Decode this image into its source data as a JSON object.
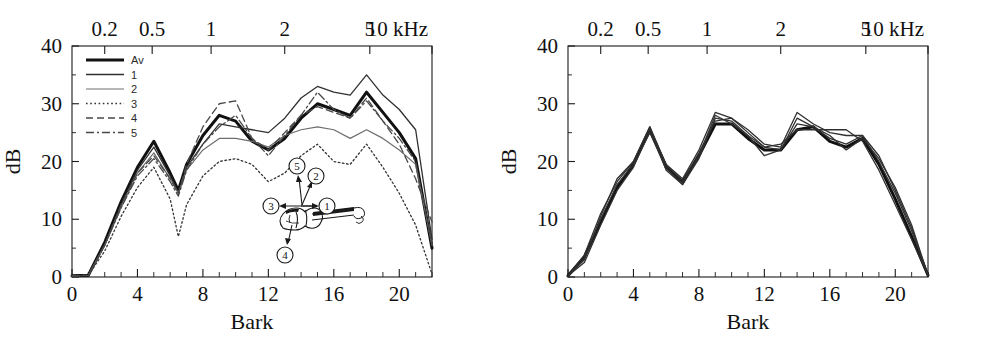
{
  "figure": {
    "background": "#ffffff",
    "ink": "#111111"
  },
  "panels": [
    {
      "id": "left",
      "name": "violin-radiation-spectrum-left",
      "axes": {
        "y": {
          "title": "dB",
          "ticks": [
            0,
            10,
            20,
            30,
            40
          ],
          "labels": [
            "0",
            "10",
            "20",
            "30",
            "40"
          ],
          "min": 0,
          "max": 40
        },
        "x_bottom": {
          "title": "Bark",
          "ticks": [
            0,
            4,
            8,
            12,
            16,
            20
          ],
          "labels": [
            "0",
            "4",
            "8",
            "12",
            "16",
            "20"
          ],
          "minor_step": 2,
          "min": 0,
          "max": 22
        },
        "x_top": {
          "title": "kHz",
          "labels": [
            "0.2",
            "0.5",
            "1",
            "2",
            "5",
            "10 kHz"
          ],
          "bark_positions": [
            2.0,
            4.9,
            8.5,
            13.0,
            18.2,
            22.0
          ]
        }
      },
      "legend": {
        "entries": [
          {
            "label": "Av",
            "style": "thick-solid",
            "color": "#111111",
            "width": 3.2,
            "dash": "none"
          },
          {
            "label": "1",
            "style": "solid",
            "color": "#333333",
            "width": 1.4,
            "dash": "none"
          },
          {
            "label": "2",
            "style": "solid-light",
            "color": "#6e6e6e",
            "width": 1.2,
            "dash": "none"
          },
          {
            "label": "3",
            "style": "dotted",
            "color": "#333333",
            "width": 1.3,
            "dash": "1.5,2.5"
          },
          {
            "label": "4",
            "style": "dashed",
            "color": "#4a4a4a",
            "width": 1.3,
            "dash": "7,4"
          },
          {
            "label": "5",
            "style": "dash-dot",
            "color": "#4a4a4a",
            "width": 1.3,
            "dash": "8,3,2,3"
          }
        ]
      },
      "inset": {
        "name": "violin-microphone-positions",
        "callouts": [
          {
            "id": "1",
            "label": "1"
          },
          {
            "id": "2",
            "label": "2"
          },
          {
            "id": "3",
            "label": "3"
          },
          {
            "id": "4",
            "label": "4"
          },
          {
            "id": "5",
            "label": "5"
          }
        ]
      }
    },
    {
      "id": "right",
      "name": "violin-radiation-spectrum-right",
      "axes": {
        "y": {
          "title": "dB",
          "ticks": [
            0,
            10,
            20,
            30,
            40
          ],
          "labels": [
            "0",
            "10",
            "20",
            "30",
            "40"
          ],
          "min": 0,
          "max": 40
        },
        "x_bottom": {
          "title": "Bark",
          "ticks": [
            0,
            4,
            8,
            12,
            16,
            20
          ],
          "labels": [
            "0",
            "4",
            "8",
            "12",
            "16",
            "20"
          ],
          "minor_step": 2,
          "min": 0,
          "max": 22
        },
        "x_top": {
          "title": "kHz",
          "labels": [
            "0.2",
            "0.5",
            "1",
            "2",
            "5",
            "10 kHz"
          ],
          "bark_positions": [
            2.0,
            4.9,
            8.5,
            13.0,
            18.2,
            22.0
          ]
        }
      }
    }
  ],
  "chart_data": [
    {
      "type": "line",
      "id": "left-panel",
      "title": "",
      "xlabel": "Bark",
      "ylabel": "dB",
      "x_top_label": "kHz",
      "xlim": [
        0,
        22
      ],
      "ylim": [
        0,
        40
      ],
      "grid": false,
      "legend_position": "top-left",
      "x": [
        0,
        1,
        2,
        3,
        4,
        5,
        6,
        6.5,
        7,
        8,
        9,
        10,
        11,
        12,
        13,
        14,
        15,
        16,
        17,
        18,
        19,
        20,
        21,
        22
      ],
      "series": [
        {
          "name": "Av",
          "style": "thick-solid",
          "values": [
            0.2,
            0.3,
            6.0,
            13.0,
            19.0,
            23.5,
            18.0,
            15.0,
            19.5,
            24.5,
            28.0,
            27.0,
            23.5,
            22.0,
            24.0,
            27.5,
            30.0,
            29.0,
            28.0,
            32.0,
            28.5,
            25.0,
            20.5,
            5.0
          ]
        },
        {
          "name": "1",
          "style": "solid",
          "values": [
            0.2,
            0.3,
            5.5,
            12.5,
            18.5,
            22.5,
            17.5,
            14.5,
            19.0,
            23.0,
            26.5,
            26.0,
            25.5,
            25.0,
            27.5,
            31.0,
            33.0,
            32.0,
            31.5,
            35.0,
            31.5,
            29.0,
            25.5,
            6.5
          ]
        },
        {
          "name": "2",
          "style": "solid-light",
          "values": [
            0.2,
            0.3,
            5.5,
            12.0,
            18.0,
            21.5,
            17.0,
            14.5,
            18.5,
            22.0,
            24.0,
            24.0,
            23.5,
            22.5,
            24.5,
            25.5,
            26.0,
            25.5,
            24.0,
            25.5,
            24.0,
            22.0,
            19.5,
            5.5
          ]
        },
        {
          "name": "3",
          "style": "dotted",
          "values": [
            0.2,
            0.3,
            4.5,
            10.5,
            15.5,
            19.0,
            13.5,
            7.0,
            12.5,
            17.5,
            20.0,
            20.5,
            19.5,
            16.5,
            18.0,
            21.0,
            23.0,
            20.0,
            19.5,
            23.0,
            19.0,
            14.5,
            9.0,
            0.5
          ]
        },
        {
          "name": "4",
          "style": "dashed",
          "values": [
            0.2,
            0.3,
            5.5,
            12.5,
            18.0,
            21.0,
            17.0,
            14.5,
            19.5,
            26.0,
            30.0,
            30.5,
            24.0,
            22.0,
            25.0,
            28.0,
            29.5,
            28.5,
            27.5,
            31.0,
            27.0,
            23.0,
            17.0,
            9.5
          ]
        },
        {
          "name": "5",
          "style": "dash-dot",
          "values": [
            0.2,
            0.3,
            5.5,
            12.0,
            17.5,
            20.5,
            16.5,
            14.0,
            18.5,
            23.0,
            26.0,
            28.0,
            24.0,
            21.0,
            24.5,
            28.0,
            32.0,
            29.0,
            27.5,
            30.5,
            27.0,
            24.0,
            20.0,
            5.5
          ]
        }
      ]
    },
    {
      "type": "line",
      "id": "right-panel",
      "title": "",
      "xlabel": "Bark",
      "ylabel": "dB",
      "x_top_label": "kHz",
      "xlim": [
        0,
        22
      ],
      "ylim": [
        0,
        40
      ],
      "grid": false,
      "legend_position": "none",
      "x": [
        0,
        1,
        2,
        3,
        4,
        5,
        6,
        7,
        8,
        9,
        10,
        11,
        12,
        13,
        14,
        15,
        16,
        17,
        18,
        19,
        20,
        21,
        22
      ],
      "series": [
        {
          "name": "Av",
          "style": "thick-solid",
          "values": [
            0.2,
            3.5,
            9.5,
            15.5,
            19.5,
            25.5,
            19.0,
            16.5,
            21.0,
            26.5,
            26.5,
            24.0,
            22.0,
            22.0,
            25.5,
            26.0,
            23.5,
            22.5,
            24.0,
            19.5,
            13.5,
            7.0,
            0.3
          ]
        },
        {
          "name": "1",
          "style": "solid",
          "values": [
            0.2,
            3.0,
            10.5,
            17.0,
            20.0,
            26.0,
            19.5,
            17.0,
            22.0,
            28.5,
            27.5,
            25.5,
            23.0,
            22.5,
            28.5,
            26.5,
            25.0,
            24.5,
            24.5,
            20.0,
            14.5,
            8.0,
            0.3
          ]
        },
        {
          "name": "2",
          "style": "solid",
          "values": [
            0.2,
            3.2,
            10.0,
            16.0,
            19.5,
            25.0,
            19.0,
            16.0,
            20.5,
            27.5,
            27.0,
            24.5,
            21.0,
            22.0,
            26.5,
            26.0,
            24.5,
            22.0,
            24.0,
            20.5,
            15.5,
            9.0,
            0.3
          ]
        },
        {
          "name": "3",
          "style": "solid",
          "values": [
            0.2,
            2.5,
            9.0,
            15.0,
            19.0,
            25.5,
            19.5,
            16.5,
            21.5,
            27.0,
            27.5,
            25.0,
            22.5,
            23.0,
            25.5,
            25.5,
            25.5,
            25.5,
            23.5,
            18.5,
            12.5,
            6.5,
            0.3
          ]
        },
        {
          "name": "4",
          "style": "solid",
          "values": [
            0.2,
            3.8,
            11.0,
            16.5,
            20.0,
            26.0,
            18.5,
            16.0,
            21.0,
            28.0,
            26.5,
            24.5,
            22.5,
            22.0,
            27.5,
            26.0,
            24.0,
            23.0,
            24.5,
            21.0,
            15.0,
            8.5,
            0.3
          ]
        }
      ]
    }
  ]
}
